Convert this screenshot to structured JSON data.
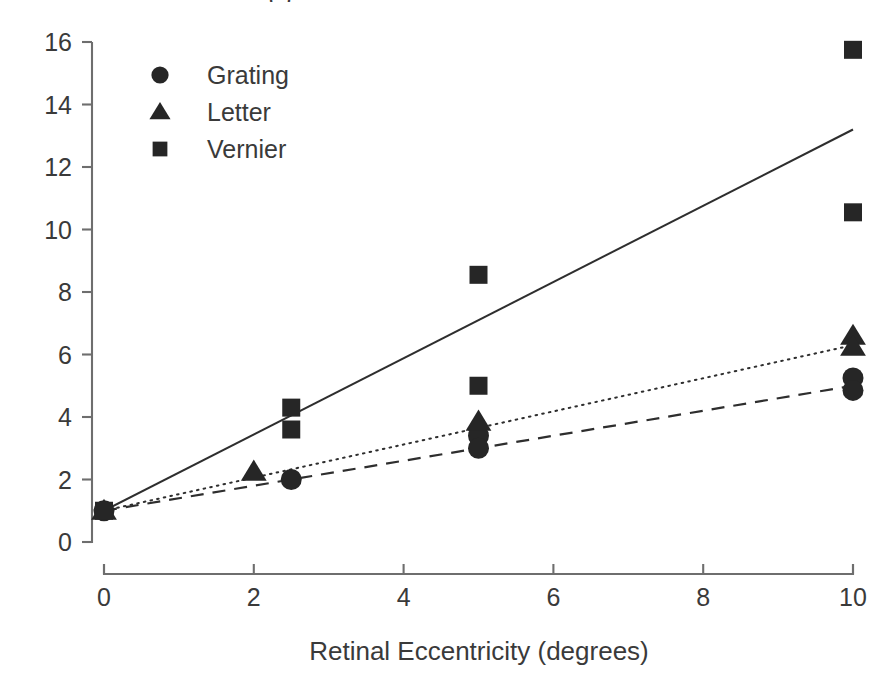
{
  "figure": {
    "cut_off_title": "(  )",
    "background_color": "#ffffff",
    "ink_color": "#262626",
    "axis_color": "#6e6e6e"
  },
  "chart_data": {
    "type": "scatter",
    "title": "",
    "xlabel": "Retinal Eccentricity (degrees)",
    "ylabel": "",
    "xlim": [
      0,
      10
    ],
    "ylim": [
      0,
      16
    ],
    "xticks": [
      0,
      2,
      4,
      6,
      8,
      10
    ],
    "yticks": [
      0,
      2,
      4,
      6,
      8,
      10,
      12,
      14,
      16
    ],
    "xtick_labels": [
      "0",
      "2",
      "4",
      "6",
      "8",
      "10"
    ],
    "ytick_labels": [
      "0",
      "2",
      "4",
      "6",
      "8",
      "10",
      "12",
      "14",
      "16"
    ],
    "grid": false,
    "legend_position": "top-left",
    "series": [
      {
        "name": "Grating",
        "marker": "circle",
        "line_style": "dashed",
        "points": [
          {
            "x": 0,
            "y": 1.0
          },
          {
            "x": 2.5,
            "y": 2.0
          },
          {
            "x": 5,
            "y": 3.4
          },
          {
            "x": 5,
            "y": 3.0
          },
          {
            "x": 10,
            "y": 5.25
          },
          {
            "x": 10,
            "y": 4.85
          }
        ],
        "fit_line": {
          "x0": 0,
          "y0": 1.0,
          "x1": 10,
          "y1": 5.0
        }
      },
      {
        "name": "Letter",
        "marker": "triangle",
        "line_style": "dotted",
        "points": [
          {
            "x": 0,
            "y": 1.0
          },
          {
            "x": 2,
            "y": 2.25
          },
          {
            "x": 5,
            "y": 3.85
          },
          {
            "x": 10,
            "y": 6.6
          },
          {
            "x": 10,
            "y": 6.25
          }
        ],
        "fit_line": {
          "x0": 0,
          "y0": 1.0,
          "x1": 10,
          "y1": 6.3
        }
      },
      {
        "name": "Vernier",
        "marker": "square",
        "line_style": "solid",
        "points": [
          {
            "x": 0,
            "y": 1.0
          },
          {
            "x": 2.5,
            "y": 4.3
          },
          {
            "x": 2.5,
            "y": 3.6
          },
          {
            "x": 5,
            "y": 8.55
          },
          {
            "x": 5,
            "y": 5.0
          },
          {
            "x": 10,
            "y": 15.75
          },
          {
            "x": 10,
            "y": 10.55
          }
        ],
        "fit_line": {
          "x0": 0,
          "y0": 1.0,
          "x1": 10,
          "y1": 13.2
        }
      }
    ]
  },
  "legend": {
    "entries": [
      {
        "label": "Grating",
        "marker": "circle"
      },
      {
        "label": "Letter",
        "marker": "triangle"
      },
      {
        "label": "Vernier",
        "marker": "square"
      }
    ]
  }
}
